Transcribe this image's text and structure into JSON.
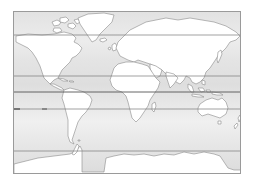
{
  "map": {
    "type": "world-outline-map",
    "projection": "cylindrical",
    "colors": {
      "ocean": "#e4e4e4",
      "land": "#ffffff",
      "coastline": "#8a8a8a",
      "frame": "#9a9a9a",
      "latitude_line": "#7a7a7a",
      "equator_line": "#555555"
    },
    "latitude_lines": [
      {
        "name": "arctic-circle",
        "y": 23
      },
      {
        "name": "tropic-of-cancer",
        "y": 64
      },
      {
        "name": "equator",
        "y": 80
      },
      {
        "name": "tropic-of-capricorn",
        "y": 97
      },
      {
        "name": "antarctic-circle",
        "y": 139
      }
    ],
    "landmasses": [
      "north-america",
      "greenland",
      "south-america",
      "europe",
      "africa",
      "madagascar",
      "asia",
      "japan",
      "indonesia",
      "australia",
      "new-zealand",
      "antarctica",
      "british-isles",
      "canadian-arctic-islands"
    ]
  }
}
